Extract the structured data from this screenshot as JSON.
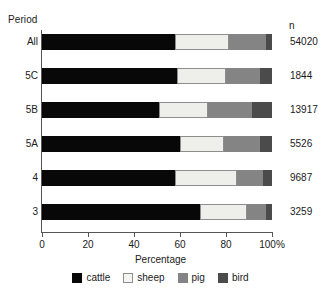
{
  "axis_titles": {
    "left": "Period",
    "right": "n",
    "x_caption": "Percentage"
  },
  "chart_data": {
    "type": "bar",
    "orientation": "horizontal",
    "stacked": true,
    "normalized": true,
    "title": "",
    "xlabel": "Percentage",
    "ylabel": "Period",
    "xlim": [
      0,
      100
    ],
    "xticks": [
      0,
      20,
      40,
      60,
      80,
      100
    ],
    "xticklabels": [
      "0",
      "20",
      "40",
      "60",
      "80",
      "100%"
    ],
    "grid": false,
    "legend_position": "bottom",
    "categories": [
      "All",
      "5C",
      "5B",
      "5A",
      "4",
      "3"
    ],
    "series": [
      {
        "name": "cattle",
        "color": "#080808",
        "values": [
          58.0,
          58.5,
          51.0,
          60.0,
          57.8,
          68.7
        ]
      },
      {
        "name": "sheep",
        "color": "#eeeeea",
        "values": [
          23.5,
          21.5,
          21.0,
          19.0,
          26.8,
          20.3
        ]
      },
      {
        "name": "pig",
        "color": "#848484",
        "values": [
          16.0,
          15.0,
          19.5,
          16.0,
          11.3,
          8.4
        ]
      },
      {
        "name": "bird",
        "color": "#4b4b4b",
        "values": [
          2.5,
          5.0,
          8.5,
          5.0,
          4.1,
          2.6
        ]
      }
    ],
    "annotations": {
      "right_column_header": "n",
      "right_column_values": [
        "54020",
        "1844",
        "13917",
        "5526",
        "9687",
        "3259"
      ]
    }
  },
  "legend": {
    "items": [
      {
        "label": "cattle",
        "color": "#080808"
      },
      {
        "label": "sheep",
        "color": "#f4f4f0"
      },
      {
        "label": "pig",
        "color": "#848484"
      },
      {
        "label": "bird",
        "color": "#4b4b4b"
      }
    ]
  }
}
